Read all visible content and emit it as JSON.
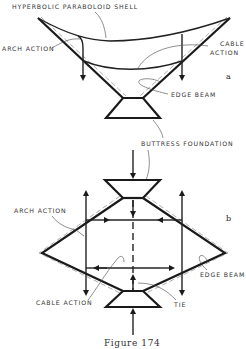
{
  "figure": {
    "caption": "Figure 174",
    "part_a": {
      "sublabel": "a",
      "labels": {
        "shell": "HYPERBOLIC PARABOLOID SHELL",
        "arch_action": "ARCH ACTION",
        "cable_action_line1": "CABLE",
        "cable_action_line2": "ACTION",
        "edge_beam": "EDGE BEAM"
      }
    },
    "shared_label": {
      "buttress_foundation": "BUTTRESS FOUNDATION"
    },
    "part_b": {
      "sublabel": "b",
      "labels": {
        "arch_action": "ARCH ACTION",
        "edge_beam": "EDGE BEAM",
        "cable_action": "CABLE ACTION",
        "tie": "TIE"
      }
    }
  },
  "colors": {
    "line": "#1a1a1a",
    "label": "#333333",
    "background": "#ffffff"
  }
}
